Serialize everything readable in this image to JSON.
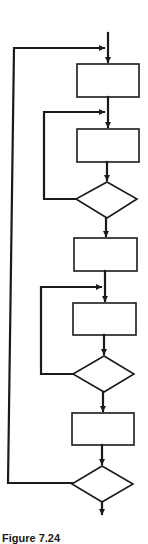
{
  "diagram": {
    "type": "flowchart",
    "colors": {
      "stroke": "#1a1a1a",
      "background": "#ffffff"
    },
    "nodes": [
      {
        "id": "process-1",
        "shape": "rectangle",
        "label": ""
      },
      {
        "id": "process-2",
        "shape": "rectangle",
        "label": ""
      },
      {
        "id": "decision-1",
        "shape": "diamond",
        "label": ""
      },
      {
        "id": "process-3",
        "shape": "rectangle",
        "label": ""
      },
      {
        "id": "process-4",
        "shape": "rectangle",
        "label": ""
      },
      {
        "id": "decision-2",
        "shape": "diamond",
        "label": ""
      },
      {
        "id": "process-5",
        "shape": "rectangle",
        "label": ""
      },
      {
        "id": "decision-3",
        "shape": "diamond",
        "label": ""
      }
    ],
    "edges": [
      {
        "from": "entry",
        "to": "process-1"
      },
      {
        "from": "process-1",
        "to": "process-2"
      },
      {
        "from": "process-2",
        "to": "decision-1"
      },
      {
        "from": "decision-1",
        "to": "process-2",
        "kind": "inner-loop-1"
      },
      {
        "from": "decision-1",
        "to": "process-3"
      },
      {
        "from": "process-3",
        "to": "process-4"
      },
      {
        "from": "process-4",
        "to": "decision-2"
      },
      {
        "from": "decision-2",
        "to": "process-4",
        "kind": "inner-loop-2"
      },
      {
        "from": "decision-2",
        "to": "process-5"
      },
      {
        "from": "process-5",
        "to": "decision-3"
      },
      {
        "from": "decision-3",
        "to": "process-1",
        "kind": "outer-loop"
      },
      {
        "from": "decision-3",
        "to": "exit"
      }
    ]
  },
  "caption": "Figure 7.24"
}
